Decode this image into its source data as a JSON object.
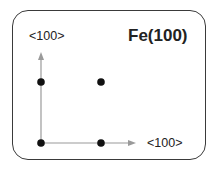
{
  "diagram": {
    "title": "Fe(100)",
    "axis_y_label": "<100>",
    "axis_x_label": "<100>",
    "atoms": [
      {
        "x": 41,
        "y": 82
      },
      {
        "x": 101,
        "y": 82
      },
      {
        "x": 41,
        "y": 143
      },
      {
        "x": 101,
        "y": 143
      }
    ],
    "colors": {
      "axis": "#9a9a9a",
      "atom": "#111111",
      "border": "#3a3a3a"
    }
  }
}
